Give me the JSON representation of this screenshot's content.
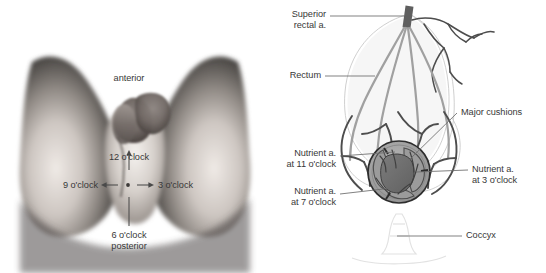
{
  "figure": {
    "width": 546,
    "height": 273,
    "background": "#ffffff",
    "text_color": "#383838"
  },
  "panel_left": {
    "name": "clinical-photograph-perineum",
    "type": "grayscale photograph",
    "description": "Perineal view in lithotomy position with clock-face orientation annotations",
    "labels": {
      "anterior": "anterior",
      "twelve": "12 o'clock",
      "nine": "9 o'clock",
      "three": "3 o'clock",
      "six": "6 o'clock",
      "posterior": "posterior"
    },
    "arrows": [
      {
        "name": "arrow-12-oclock",
        "direction": "up"
      },
      {
        "name": "arrow-9-oclock",
        "direction": "left"
      },
      {
        "name": "arrow-3-oclock",
        "direction": "right"
      },
      {
        "name": "arrow-6-oclock",
        "direction": "down"
      }
    ]
  },
  "panel_right": {
    "name": "rectal-arterial-supply-diagram",
    "type": "line diagram",
    "labels": {
      "superior_rectal_line1": "Superior",
      "superior_rectal_line2": "rectal a.",
      "rectum": "Rectum",
      "major_cushions": "Major cushions",
      "nutrient_11_line1": "Nutrient a.",
      "nutrient_11_line2": "at 11 o'clock",
      "nutrient_7_line1": "Nutrient a.",
      "nutrient_7_line2": "at 7 o'clock",
      "nutrient_3_line1": "Nutrient a.",
      "nutrient_3_line2": "at 3 o'clock",
      "coccyx": "Coccyx"
    },
    "colors": {
      "vessel_dark": "#4a4a4a",
      "vessel_mid": "#9a9a9a",
      "outline_faint": "#c9c9c9",
      "cushion_fill": "#8d8d8d",
      "canal_fill": "#6e6e6e",
      "leader_line": "#6a6a6a"
    }
  }
}
